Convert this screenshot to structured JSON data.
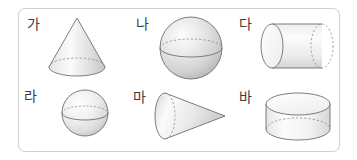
{
  "panel": {
    "border_color": "#d2d2d2",
    "background_color": "#ffffff",
    "corner_radius_px": 7
  },
  "figure": {
    "kind": "geometry-solids-panel",
    "rows": 2,
    "columns": 3,
    "stroke_color": "#6e6e6e",
    "hidden_edge_style": "dashed",
    "fill_gradient_light": "#ffffff",
    "fill_gradient_dark": "#c9c9c9",
    "items": [
      {
        "label": "가",
        "shape_name": "cone",
        "orientation": "upright",
        "row": 1,
        "column": 1
      },
      {
        "label": "나",
        "shape_name": "sphere",
        "orientation": "upright",
        "row": 1,
        "column": 2
      },
      {
        "label": "다",
        "shape_name": "cylinder",
        "orientation": "horizontal",
        "row": 1,
        "column": 3
      },
      {
        "label": "라",
        "shape_name": "sphere",
        "orientation": "upright",
        "row": 2,
        "column": 1
      },
      {
        "label": "마",
        "shape_name": "cone",
        "orientation": "sideways-right",
        "row": 2,
        "column": 2
      },
      {
        "label": "바",
        "shape_name": "cylinder",
        "orientation": "upright-short",
        "row": 2,
        "column": 3
      }
    ]
  }
}
